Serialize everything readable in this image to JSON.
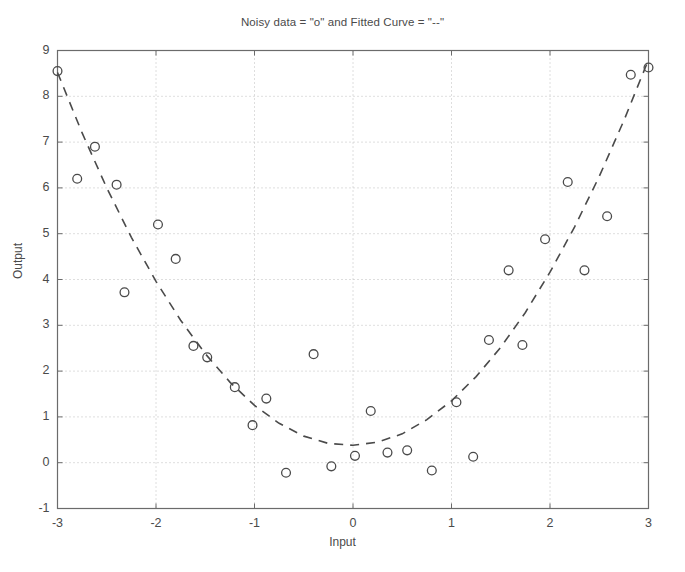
{
  "figure": {
    "width": 685,
    "height": 572,
    "background": "#ffffff",
    "axes_color": "#6b6b6b",
    "grid_color": "#bdbdbd",
    "marker_color": "#4a4a4a",
    "curve_color": "#4a4a4a"
  },
  "chart_data": {
    "type": "scatter",
    "title": "Noisy data = \"o\" and Fitted Curve = \"--\"",
    "xlabel": "Input",
    "ylabel": "Output",
    "xlim": [
      -3,
      3
    ],
    "ylim": [
      -1,
      9
    ],
    "xticks": [
      -3,
      -2,
      -1,
      0,
      1,
      2,
      3
    ],
    "yticks": [
      -1,
      0,
      1,
      2,
      3,
      4,
      5,
      6,
      7,
      8,
      9
    ],
    "xtick_labels": [
      "-3",
      "-2",
      "-1",
      "0",
      "1",
      "2",
      "3"
    ],
    "ytick_labels": [
      "-1",
      "0",
      "1",
      "2",
      "3",
      "4",
      "5",
      "6",
      "7",
      "8",
      "9"
    ],
    "grid": true,
    "grid_style": "dotted",
    "legend": null,
    "series": [
      {
        "name": "Noisy data",
        "type": "scatter",
        "marker": "o",
        "marker_filled": false,
        "points": [
          [
            -3.0,
            8.55
          ],
          [
            -2.8,
            6.2
          ],
          [
            -2.62,
            6.9
          ],
          [
            -2.4,
            6.07
          ],
          [
            -2.32,
            3.72
          ],
          [
            -1.98,
            5.2
          ],
          [
            -1.8,
            4.45
          ],
          [
            -1.62,
            2.55
          ],
          [
            -1.48,
            2.3
          ],
          [
            -1.2,
            1.65
          ],
          [
            -1.02,
            0.82
          ],
          [
            -0.88,
            1.4
          ],
          [
            -0.68,
            -0.22
          ],
          [
            -0.4,
            2.37
          ],
          [
            -0.22,
            -0.08
          ],
          [
            0.02,
            0.15
          ],
          [
            0.18,
            1.13
          ],
          [
            0.35,
            0.22
          ],
          [
            0.55,
            0.27
          ],
          [
            0.8,
            -0.17
          ],
          [
            1.05,
            1.32
          ],
          [
            1.22,
            0.13
          ],
          [
            1.38,
            2.68
          ],
          [
            1.58,
            4.2
          ],
          [
            1.72,
            2.57
          ],
          [
            1.95,
            4.88
          ],
          [
            2.18,
            6.13
          ],
          [
            2.35,
            4.2
          ],
          [
            2.58,
            5.38
          ],
          [
            2.82,
            8.47
          ],
          [
            3.0,
            8.63
          ]
        ]
      },
      {
        "name": "Fitted Curve",
        "type": "line",
        "linestyle": "--",
        "model": "quadratic",
        "coefficients": {
          "a": 0.92,
          "b": 0.05,
          "c": 0.38
        },
        "points": [
          [
            -3.0,
            8.52
          ],
          [
            -2.75,
            7.2
          ],
          [
            -2.5,
            6.0
          ],
          [
            -2.25,
            4.92
          ],
          [
            -2.0,
            3.96
          ],
          [
            -1.75,
            3.11
          ],
          [
            -1.5,
            2.38
          ],
          [
            -1.25,
            1.76
          ],
          [
            -1.0,
            1.25
          ],
          [
            -0.75,
            0.86
          ],
          [
            -0.5,
            0.58
          ],
          [
            -0.25,
            0.42
          ],
          [
            0.0,
            0.38
          ],
          [
            0.25,
            0.45
          ],
          [
            0.5,
            0.63
          ],
          [
            0.75,
            0.94
          ],
          [
            1.0,
            1.35
          ],
          [
            1.25,
            1.88
          ],
          [
            1.5,
            2.52
          ],
          [
            1.75,
            3.28
          ],
          [
            2.0,
            4.16
          ],
          [
            2.25,
            5.15
          ],
          [
            2.5,
            6.25
          ],
          [
            2.75,
            7.47
          ],
          [
            3.0,
            8.8
          ]
        ]
      }
    ]
  }
}
